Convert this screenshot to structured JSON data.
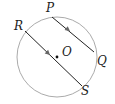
{
  "diagram": {
    "type": "circle-parallel-chords",
    "circle": {
      "cx": 57,
      "cy": 57,
      "r": 40,
      "stroke": "#9a9a9a"
    },
    "center": {
      "label": "O",
      "x": 57,
      "y": 57
    },
    "chords": [
      {
        "name": "PQ",
        "from": {
          "label": "P",
          "x": 52,
          "y": 17
        },
        "to": {
          "label": "Q",
          "x": 94,
          "y": 52
        },
        "arrow_at": {
          "x": 69,
          "y": 31
        }
      },
      {
        "name": "RS",
        "from": {
          "label": "R",
          "x": 25,
          "y": 31
        },
        "to": {
          "label": "S",
          "x": 82,
          "y": 86
        },
        "arrow_at": {
          "x": 49,
          "y": 54
        }
      }
    ],
    "labels": {
      "P": "P",
      "Q": "Q",
      "R": "R",
      "S": "S",
      "O": "O"
    },
    "line_color": "#222222"
  }
}
